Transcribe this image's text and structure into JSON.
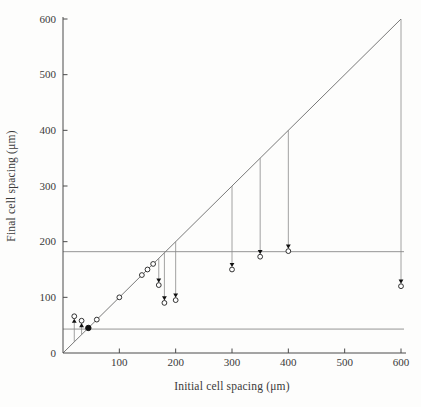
{
  "chart_data": {
    "type": "scatter",
    "title": "",
    "xlabel": "Initial cell spacing (μm)",
    "ylabel": "Final cell spacing (μm)",
    "xlim": [
      0,
      620
    ],
    "ylim": [
      0,
      600
    ],
    "x_ticks": [
      100,
      200,
      300,
      400,
      500,
      600
    ],
    "y_ticks": [
      0,
      100,
      200,
      300,
      400,
      500,
      600
    ],
    "grid": false,
    "legend": "none",
    "identity_line": {
      "x_from": 0,
      "x_to": 600,
      "meaning": "final = initial (y = x)"
    },
    "reference_lines": [
      {
        "axis": "y",
        "value": 182,
        "meaning": "upper critical spacing"
      },
      {
        "axis": "y",
        "value": 43,
        "meaning": "lower critical spacing"
      }
    ],
    "stationary_points": {
      "marker": "open-circle",
      "meaning": "cells that did not move (on diagonal)",
      "values": [
        60,
        100,
        140,
        150,
        160
      ]
    },
    "fixed_point": {
      "marker": "filled-circle",
      "initial": 45,
      "final": 45
    },
    "moved_points": [
      {
        "initial": 20,
        "final": 66,
        "direction": "up"
      },
      {
        "initial": 33,
        "final": 58,
        "direction": "up"
      },
      {
        "initial": 170,
        "final": 122,
        "direction": "down"
      },
      {
        "initial": 180,
        "final": 90,
        "direction": "down"
      },
      {
        "initial": 200,
        "final": 95,
        "direction": "down"
      },
      {
        "initial": 300,
        "final": 150,
        "direction": "down"
      },
      {
        "initial": 350,
        "final": 173,
        "direction": "down"
      },
      {
        "initial": 400,
        "final": 183,
        "direction": "down"
      },
      {
        "initial": 600,
        "final": 120,
        "direction": "down"
      }
    ]
  },
  "colors": {
    "background": "#fdfdfc",
    "axis": "#4a4a4a",
    "diagonal": "#6a6a6a",
    "reference_line": "#7a7a7a",
    "arrow_line": "#8a8a8a",
    "marker_stroke": "#1c1c1c",
    "marker_fill": "#ffffff",
    "arrowhead_fill": "#111111",
    "text": "#3a3a3a"
  }
}
